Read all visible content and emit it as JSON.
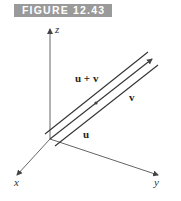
{
  "figure": {
    "label": "FIGURE 12.43",
    "label_bg": "#9a9a9a"
  },
  "axes": {
    "x_label": "x",
    "y_label": "y",
    "z_label": "z"
  },
  "vectors": {
    "sum_label": "u + v",
    "v_label": "v",
    "u_label": "u"
  },
  "colors": {
    "line": "#333333",
    "axis": "#555555"
  }
}
